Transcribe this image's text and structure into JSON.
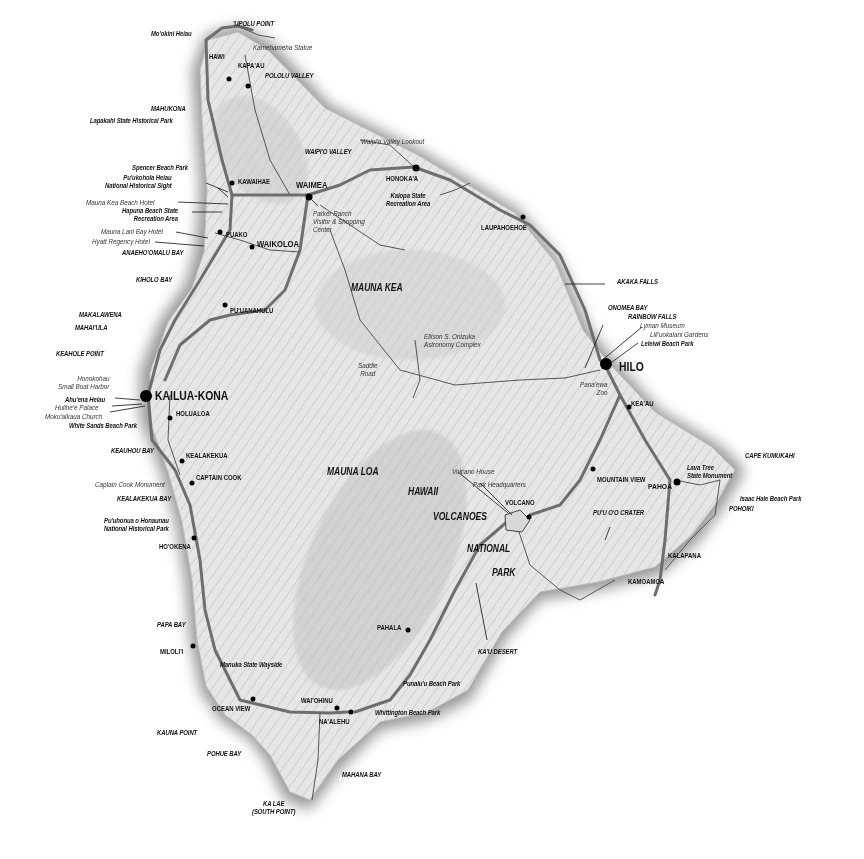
{
  "map": {
    "subject": "Island of Hawai'i",
    "colors": {
      "background": "#ffffff",
      "land": "#e4e4e4",
      "shore_shadow": "#9a9a9a",
      "highway": "#6e6e6e",
      "minor_road": "#555555",
      "label": "#111111",
      "town_dot": "#000000"
    },
    "cities": {
      "kailua_kona": "KAILUA-KONA",
      "hilo": "HILO"
    },
    "towns": {
      "hawi": "HAWI",
      "kapaau": "KAPA'AU",
      "kawaihae": "KAWAIHAE",
      "waimea": "WAIMEA",
      "honokaa": "HONOKA'A",
      "laupahoehoe": "LAUPAHOEHOE",
      "puako": "PUAKO",
      "waikoloa": "WAIKOLOA",
      "puuanahulu": "PU'UANAHULU",
      "holualoa": "HOLUALOA",
      "kealakekua": "KEALAKEKUA",
      "captain_cook": "CAPTAIN COOK",
      "hookena": "HO'OKENA",
      "milolii": "MILOLI'I",
      "ocean_view": "OCEAN VIEW",
      "waiohinu": "WAI'OHINU",
      "naalehu": "NA'ALEHU",
      "pahala": "PAHALA",
      "volcano": "VOLCANO",
      "mountain_view": "MOUNTAIN VIEW",
      "keaau": "KEA'AU",
      "pahoa": "PAHOA",
      "kalapana": "KALAPANA",
      "kamoamoa": "KAMOAMOA"
    },
    "regions": {
      "mauna_kea": "MAUNA KEA",
      "mauna_loa": "MAUNA LOA",
      "hawaii": "HAWAII",
      "volcanoes": "VOLCANOES",
      "national": "NATIONAL",
      "park": "PARK"
    },
    "coastal_features": {
      "upolu_point": "'UPOLU POINT",
      "mookini_heiau": "Mo'okini Heiau",
      "mahukona": "MAHUKONA",
      "lapakahi": "Lapakahi State Historical Park",
      "pololu_valley": "POLOLU VALLEY",
      "waipio_valley": "WAIPI'O VALLEY",
      "spencer_beach": "Spencer Beach Park",
      "puukohola": "Pu'ukohola Heiau\nNational Historical Sight",
      "hapuna": "Hapuna Beach State\nRecreation Area",
      "anaehoomalu": "ANAEHO'OMALU BAY",
      "kiholo": "KIHOLO BAY",
      "makalawena": "MAKALAWENA",
      "mahaiula": "MAHAI'ULA",
      "keahole": "KEAHOLE POINT",
      "ahuena": "Ahu'ena Heiau",
      "white_sands": "White Sands Beach Park",
      "keauhou": "KEAUHOU BAY",
      "kealakekua_bay": "KEALAKEKUA BAY",
      "puuhonua": "Pu'uhonua o Honaunau\nNational Historical Park",
      "papa_bay": "PAPA BAY",
      "kauna_point": "KAUNA POINT",
      "pohue_bay": "POHUE BAY",
      "mahana_bay": "MAHANA BAY",
      "ka_lae": "KA LAE\n(SOUTH POINT)",
      "manuka": "Manuka State Wayside",
      "whittington": "Whittington Beach Park",
      "punaluu": "Punalu'u Beach Park",
      "kau_desert": "KA'U DESERT",
      "puuoo": "PU'U O'O CRATER",
      "cape_kumukahi": "CAPE KUMUKAHI",
      "lava_tree": "Lava Tree\nState Monument",
      "isaac_hale": "Isaac Hale Beach Park",
      "pohoiki": "POHOIKI",
      "kalopa": "Kalopa State\nRecreation Area",
      "akaka": "AKAKA FALLS",
      "onomea": "ONOMEA BAY",
      "rainbow": "RAINBOW FALLS",
      "leleiwi": "Leleiwi Beach Park"
    },
    "points_of_interest": {
      "kamehameha_statue": "Kamehameha Statue",
      "waipio_lookout": "Waipi'o Valley Lookout",
      "mauna_kea_hotel": "Mauna Kea Beach Hotel",
      "mauna_lani": "Mauna Lani Bay Hotel",
      "hyatt": "Hyatt Regency Hotel",
      "parker_ranch": "Parker Ranch\nVisitor & Shopping\nCenter",
      "onizuka": "Ellison S. Onizuka\nAstronomy Complex",
      "saddle_road": "Saddle\nRoad",
      "honokohau": "Honokohau\nSmall Boat Harbor",
      "hulihee": "Hulihe'e Palace",
      "mokuaikaua": "Moku'aikaua Church",
      "captain_cook_monument": "Captain Cook Monument",
      "volcano_house": "Volcano House",
      "park_hq": "Park Headquarters",
      "lyman": "Lyman Museum",
      "liliuokalani": "Lili'uokalani Gardens",
      "panaewa": "Pana'ewa\nZoo"
    }
  }
}
